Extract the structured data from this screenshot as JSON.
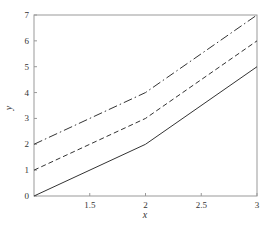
{
  "chart_data": {
    "type": "line",
    "title": "",
    "xlabel": "x",
    "ylabel": "y",
    "xlim": [
      1,
      3
    ],
    "ylim": [
      0,
      7
    ],
    "grid": false,
    "legend": null,
    "x_ticks": [
      "1.5",
      "2",
      "2.5",
      "3"
    ],
    "y_ticks": [
      "0",
      "1",
      "2",
      "3",
      "4",
      "5",
      "6",
      "7"
    ],
    "x": [
      1,
      2,
      3
    ],
    "series": [
      {
        "name": "solid",
        "style": "solid",
        "values": [
          0,
          2,
          5
        ]
      },
      {
        "name": "dashed",
        "style": "dashed",
        "values": [
          1,
          3,
          6
        ]
      },
      {
        "name": "dash-dot",
        "style": "dashdot",
        "values": [
          2,
          4,
          7
        ]
      }
    ]
  },
  "colors": {
    "line": "#333333",
    "axis": "#999999"
  }
}
